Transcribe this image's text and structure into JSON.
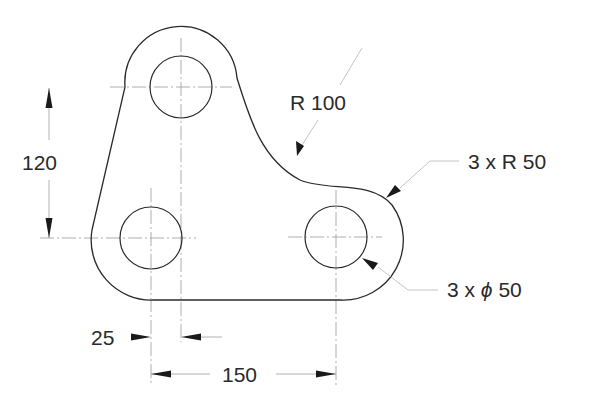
{
  "drawing": {
    "title": "Plate with three holes",
    "dimensions": {
      "vertical_spacing": "120",
      "hole_offset": "25",
      "horizontal_spacing": "150",
      "concave_radius": "R 100",
      "corner_radii": "3 x R 50",
      "hole_diameter_prefix": "3 x ",
      "hole_diameter_symbol": "ϕ",
      "hole_diameter_value": " 50"
    }
  }
}
